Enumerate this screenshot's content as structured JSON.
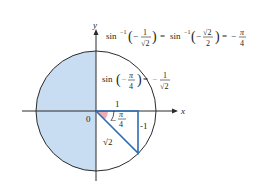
{
  "diagram": {
    "axes": {
      "x_label": "x",
      "y_label": "y",
      "origin_label": "0"
    },
    "shaded_region": "left half of unit circle (range of arcsin excluded)",
    "triangle": {
      "horizontal_leg_label": "1",
      "vertical_leg_label": "-1",
      "hypotenuse_label": "√2",
      "angle_label": {
        "sign": "−",
        "num": "π",
        "den": "4"
      }
    },
    "top_equation": {
      "fn1": "sin",
      "exp": "−1",
      "arg1": {
        "sign": "−",
        "num": "1",
        "den": "√2"
      },
      "eq1": "=",
      "fn2": "sin",
      "arg2": {
        "sign": "−",
        "num": "√2",
        "den": "2"
      },
      "eq2": "=",
      "result": {
        "sign": "−",
        "num": "π",
        "den": "4"
      }
    },
    "mid_equation": {
      "fn": "sin",
      "arg": {
        "sign": "−",
        "num": "π",
        "den": "4"
      },
      "eq": "=",
      "result": {
        "sign": "−",
        "num": "1",
        "den": "√2"
      }
    },
    "colors": {
      "shade": "#c9ddf2",
      "circle": "#2b2b2b",
      "triangle": "#2e6db4",
      "angle_fill": "#f2aab0",
      "highlight": "#3fb3a6"
    }
  }
}
